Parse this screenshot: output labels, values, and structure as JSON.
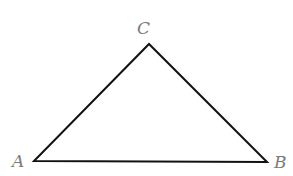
{
  "diagram": {
    "type": "triangle",
    "stroke_color": "#111111",
    "label_color": "#7a7a7a",
    "vertices": [
      {
        "name": "A",
        "x": 34,
        "y": 161,
        "label": "A",
        "label_x": 12,
        "label_y": 153
      },
      {
        "name": "B",
        "x": 267,
        "y": 162,
        "label": "B",
        "label_x": 274,
        "label_y": 154
      },
      {
        "name": "C",
        "x": 149,
        "y": 44,
        "label": "C",
        "label_x": 137,
        "label_y": 20
      }
    ],
    "edges": [
      {
        "from": "A",
        "to": "B"
      },
      {
        "from": "B",
        "to": "C"
      },
      {
        "from": "C",
        "to": "A"
      }
    ]
  }
}
